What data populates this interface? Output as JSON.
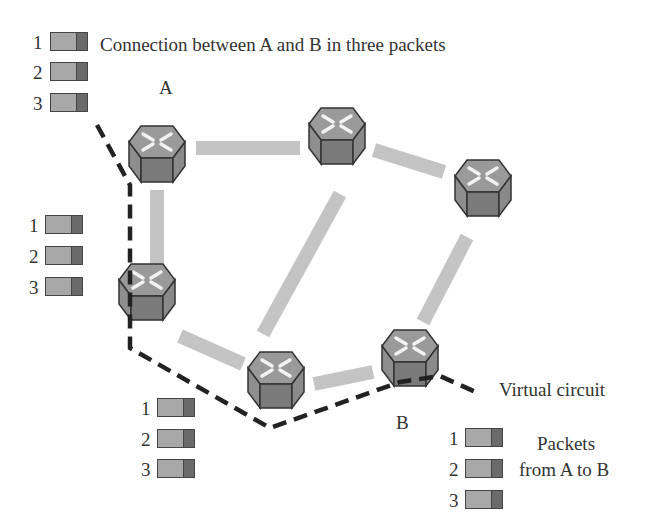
{
  "title": "Connection between A and B in three packets",
  "labels": {
    "node_a": "A",
    "node_b": "B",
    "virtual_circuit": "Virtual circuit",
    "packets_line1": "Packets",
    "packets_line2": "from A to B"
  },
  "packet_groups": [
    {
      "name": "source",
      "packets": [
        "1",
        "2",
        "3"
      ]
    },
    {
      "name": "left-router",
      "packets": [
        "1",
        "2",
        "3"
      ]
    },
    {
      "name": "bottom-router",
      "packets": [
        "1",
        "2",
        "3"
      ]
    },
    {
      "name": "destination",
      "packets": [
        "1",
        "2",
        "3"
      ]
    }
  ],
  "colors": {
    "link": "#c4c4c4",
    "virtual_circuit": "#222222",
    "router_top": "#9a9a9a",
    "router_front": "#7a7a7a",
    "router_side": "#8e8e8e",
    "packet_body": "#a8a8a8",
    "packet_header": "#6a6a6a"
  }
}
